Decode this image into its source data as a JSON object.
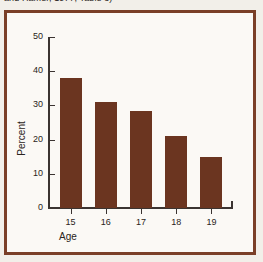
{
  "caption": {
    "text": "and Hamer, 1977, Table 3)"
  },
  "chart_data": {
    "type": "bar",
    "title": "",
    "xlabel": "Age",
    "ylabel": "Percent",
    "categories": [
      "15",
      "16",
      "17",
      "18",
      "19"
    ],
    "values": [
      38,
      31,
      28.5,
      21,
      15
    ],
    "ylim": [
      0,
      50
    ],
    "yticks": [
      0,
      10,
      20,
      30,
      40,
      50
    ],
    "ytick_labels": [
      "0",
      "10",
      "20",
      "30",
      "40",
      "50"
    ],
    "xtick_labels": [
      "15",
      "16",
      "17",
      "18",
      "19"
    ],
    "grid": false,
    "legend": null,
    "bar_color": "#6b3520",
    "frame_color": "#7a3f27",
    "background_color": "#fbf9f5",
    "axis_color": "#3b3431"
  }
}
